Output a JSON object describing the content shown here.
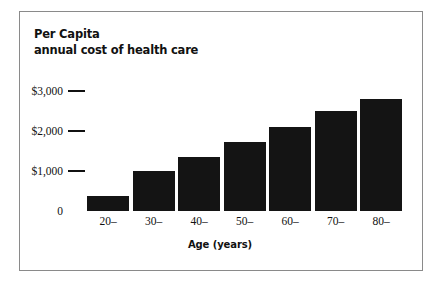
{
  "figure": {
    "border_color": "#8a8a8a",
    "background": "#ffffff"
  },
  "title": {
    "line1": "Per Capita",
    "line2": "annual cost of health care"
  },
  "axes": {
    "x_title": "Age (years)",
    "y_ticks": [
      "$3,000",
      "$2,000",
      "$1,000",
      "0"
    ],
    "x_ticks": [
      "20–",
      "30–",
      "40–",
      "50–",
      "60–",
      "70–",
      "80–"
    ]
  },
  "chart_data": {
    "type": "bar",
    "title": "Per Capita annual cost of health care",
    "xlabel": "Age (years)",
    "ylabel": "",
    "categories": [
      "20–",
      "30–",
      "40–",
      "50–",
      "60–",
      "70–",
      "80–"
    ],
    "values": [
      375,
      1000,
      1350,
      1725,
      2100,
      2500,
      2800
    ],
    "ylim": [
      0,
      3000
    ],
    "ytick_values": [
      3000,
      2000,
      1000,
      0
    ],
    "ytick_labels": [
      "$3,000",
      "$2,000",
      "$1,000",
      "0"
    ],
    "bar_color": "#141414",
    "grid": false,
    "legend": null,
    "units": "US dollars per person per year"
  }
}
